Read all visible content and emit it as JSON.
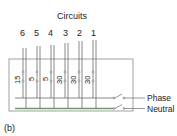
{
  "title": "Circuits",
  "caption": "(b)",
  "circuits": [
    {
      "number": "6",
      "rating": "15"
    },
    {
      "number": "5",
      "rating": "5"
    },
    {
      "number": "4",
      "rating": "5"
    },
    {
      "number": "3",
      "rating": "30"
    },
    {
      "number": "2",
      "rating": "30"
    },
    {
      "number": "1",
      "rating": "30"
    }
  ],
  "buses": {
    "phase_label": "Phase",
    "neutral_label": "Neutral"
  },
  "colors": {
    "wire": "#6a6a6a",
    "neutral_bus": "#6f9a6c",
    "box": "#8a8a8a",
    "text": "#222222"
  }
}
